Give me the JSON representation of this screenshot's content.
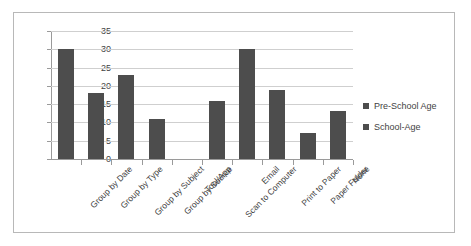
{
  "chart_data": {
    "type": "bar",
    "title": "",
    "xlabel": "",
    "ylabel": "",
    "ylim": [
      0,
      35
    ],
    "yticks": [
      0,
      5,
      10,
      15,
      20,
      25,
      30,
      35
    ],
    "grid": true,
    "legend_position": "right",
    "categories": [
      "Group by Date",
      "Group by Type",
      "Group by Subject",
      "Group by Source",
      "Tool/App",
      "Scan to Computer",
      "Email",
      "Print to Paper",
      "Paper Folder",
      "None"
    ],
    "series": [
      {
        "name": "Pre-School Age",
        "color": "#4d4d4d",
        "values": [
          30,
          18,
          23,
          11,
          0,
          16,
          30,
          19,
          7,
          13
        ]
      },
      {
        "name": "School-Age",
        "color": "#4d4d4d",
        "values": [
          null,
          null,
          null,
          null,
          null,
          null,
          null,
          null,
          null,
          null
        ]
      }
    ],
    "legend": [
      {
        "label": "Pre-School Age",
        "color": "#4d4d4d"
      },
      {
        "label": "School-Age",
        "color": "#4d4d4d"
      }
    ]
  },
  "style": {
    "frame_border": "#b8b8b8",
    "grid_color": "#cfcfcf",
    "axis_color": "#9a9a9a",
    "bar_color": "#4d4d4d",
    "text_color": "#3f3f3f",
    "background": "#ffffff"
  }
}
